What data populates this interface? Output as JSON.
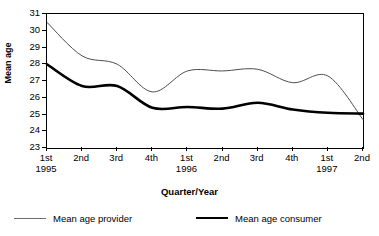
{
  "chart_data": {
    "type": "line",
    "title": "",
    "xlabel": "Quarter/Year",
    "ylabel": "Mean age",
    "categories": [
      "1st 1995",
      "2nd",
      "3rd",
      "4th",
      "1st 1996",
      "2nd",
      "3rd",
      "4th",
      "1st 1997",
      "2nd"
    ],
    "x_tick_labels": [
      {
        "quarter": "1st",
        "year": "1995"
      },
      {
        "quarter": "2nd",
        "year": ""
      },
      {
        "quarter": "3rd",
        "year": ""
      },
      {
        "quarter": "4th",
        "year": ""
      },
      {
        "quarter": "1st",
        "year": "1996"
      },
      {
        "quarter": "2nd",
        "year": ""
      },
      {
        "quarter": "3rd",
        "year": ""
      },
      {
        "quarter": "4th",
        "year": ""
      },
      {
        "quarter": "1st",
        "year": "1997"
      },
      {
        "quarter": "2nd",
        "year": ""
      }
    ],
    "y_tick_labels": [
      "31",
      "30",
      "29",
      "28",
      "27",
      "26",
      "25",
      "24",
      "23"
    ],
    "ylim": [
      23,
      31
    ],
    "grid": false,
    "legend_position": "bottom",
    "series": [
      {
        "name": "Mean age provider",
        "style": "thin",
        "color": "#000000",
        "values": [
          30.5,
          28.5,
          28.0,
          26.35,
          27.6,
          27.6,
          27.7,
          26.9,
          27.3,
          24.7
        ]
      },
      {
        "name": "Mean age consumer",
        "style": "thick",
        "color": "#000000",
        "values": [
          28.0,
          26.7,
          26.7,
          25.4,
          25.45,
          25.35,
          25.7,
          25.3,
          25.1,
          25.05
        ]
      }
    ]
  },
  "axis": {
    "y_title": "Mean age",
    "x_title": "Quarter/Year"
  },
  "legend": {
    "provider_label": "Mean age provider",
    "consumer_label": "Mean age consumer"
  }
}
